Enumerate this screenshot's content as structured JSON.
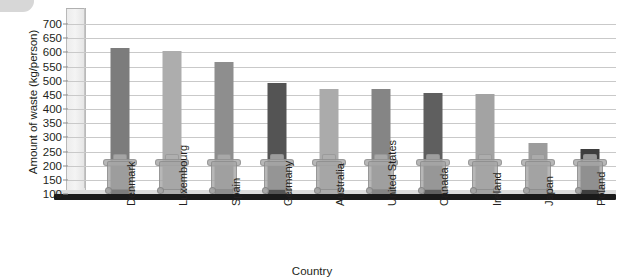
{
  "chart_data": {
    "type": "bar",
    "title": "",
    "xlabel": "Country",
    "ylabel": "Amount of waste (kg/person)",
    "categories": [
      "Denmark",
      "Luxembourg",
      "Spain",
      "Germany",
      "Australia",
      "United States",
      "Canada",
      "Ireland",
      "Japan",
      "Poland"
    ],
    "values": [
      615,
      605,
      565,
      492,
      472,
      470,
      455,
      452,
      280,
      260
    ],
    "ylim": [
      100,
      700
    ],
    "yticks": [
      100,
      150,
      200,
      250,
      300,
      350,
      400,
      450,
      500,
      550,
      600,
      650,
      700
    ],
    "ytick_labels": [
      "100",
      "150",
      "200",
      "250",
      "300",
      "350",
      "400",
      "450",
      "500",
      "550",
      "600",
      "650",
      "700"
    ],
    "grid": true,
    "legend": "none",
    "bar_colors": [
      "#7c7c7c",
      "#adadad",
      "#8e8e8e",
      "#545454",
      "#ababab",
      "#858585",
      "#5f5f5f",
      "#a3a3a3",
      "#9c9c9c",
      "#3e3e3e"
    ],
    "decoration": "each bar is overlaid with a grey wheelie-bin illustration at its base"
  },
  "axes": {
    "y_title": "Amount of waste (kg/person)",
    "x_title": "Country"
  }
}
